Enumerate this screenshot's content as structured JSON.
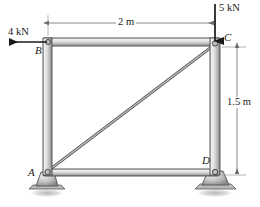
{
  "figure": {
    "type": "statics-frame-free-body-diagram",
    "width": 260,
    "height": 207,
    "background_color": "#ffffff"
  },
  "joints": [
    {
      "id": "A",
      "label": "A",
      "x": 47,
      "y": 172,
      "support": "pin-rocker",
      "label_x": 27,
      "label_y": 170
    },
    {
      "id": "B",
      "label": "B",
      "x": 48,
      "y": 41,
      "support": "none",
      "label_x": 35,
      "label_y": 45
    },
    {
      "id": "C",
      "label": "C",
      "x": 215,
      "y": 44,
      "support": "none",
      "label_x": 223,
      "label_y": 32
    },
    {
      "id": "D",
      "label": "D",
      "x": 215,
      "y": 172,
      "support": "pin-rocker",
      "label_x": 203,
      "label_y": 157
    }
  ],
  "members": [
    {
      "name": "top-chord-BC",
      "from": "B",
      "to": "C"
    },
    {
      "name": "left-column-AB",
      "from": "A",
      "to": "B"
    },
    {
      "name": "right-column-CD",
      "from": "C",
      "to": "D"
    },
    {
      "name": "bottom-chord-AD",
      "from": "A",
      "to": "D"
    },
    {
      "name": "diagonal-AC",
      "from": "A",
      "to": "C"
    }
  ],
  "loads": [
    {
      "name": "load-at-B",
      "label": "4 kN",
      "magnitude": 4,
      "unit": "kN",
      "direction": "left",
      "applied_at": "B",
      "label_x": 8,
      "label_y": 29
    },
    {
      "name": "load-at-C",
      "label": "5 kN",
      "magnitude": 5,
      "unit": "kN",
      "direction": "down",
      "applied_at": "C",
      "label_x": 218,
      "label_y": 4
    }
  ],
  "dimensions": [
    {
      "name": "horizontal-span",
      "label": "2 m",
      "value": 2,
      "unit": "m",
      "orientation": "horizontal",
      "from_joint": "B",
      "to_joint": "C",
      "label_x": 116,
      "label_y": 18
    },
    {
      "name": "vertical-height",
      "label": "1.5 m",
      "value": 1.5,
      "unit": "m",
      "orientation": "vertical",
      "from_joint": "C",
      "to_joint": "D",
      "label_x": 226,
      "label_y": 102
    }
  ],
  "colors": {
    "member_fill_light": "#e8e8e8",
    "member_fill_mid": "#c9c9c9",
    "member_fill_dark": "#9a9a9a",
    "member_outline": "#4a4a4a",
    "support_fill": "#b5b5b5",
    "ground_shadow": "#bdbdbd",
    "line": "#1a1a1a",
    "dim_line": "#8e8e8e",
    "text": "#1a1a1a"
  }
}
